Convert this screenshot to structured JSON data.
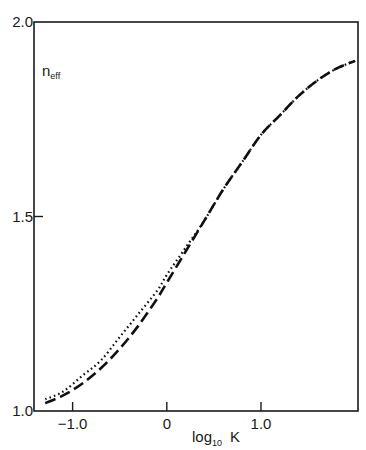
{
  "chart_data": {
    "type": "line",
    "title": "",
    "xlabel": "log",
    "xlabel_subscript": "10",
    "xlabel_suffix": "K",
    "ylabel": "n",
    "ylabel_subscript": "eff",
    "xlim": [
      -1.41,
      2.03
    ],
    "ylim": [
      1.0,
      2.0
    ],
    "grid": false,
    "legend": "none",
    "x_ticks": [
      {
        "value": -1.0,
        "label": "-1.0"
      },
      {
        "value": 0,
        "label": "0"
      },
      {
        "value": 1.0,
        "label": "1.0"
      }
    ],
    "y_ticks": [
      {
        "value": 1.0,
        "label": "1.0"
      },
      {
        "value": 1.5,
        "label": "1.5"
      },
      {
        "value": 2.0,
        "label": "2.0"
      }
    ],
    "series": [
      {
        "name": "dashed",
        "style": "dashed",
        "x": [
          -1.29,
          -1.1,
          -0.9,
          -0.7,
          -0.5,
          -0.3,
          -0.1,
          0.0,
          0.2,
          0.4,
          0.6,
          0.8,
          1.0,
          1.2,
          1.4,
          1.6,
          1.8,
          2.0
        ],
        "y": [
          1.02,
          1.04,
          1.07,
          1.11,
          1.16,
          1.22,
          1.29,
          1.33,
          1.41,
          1.49,
          1.57,
          1.64,
          1.71,
          1.76,
          1.81,
          1.85,
          1.88,
          1.9
        ]
      },
      {
        "name": "dotted",
        "style": "dotted",
        "x": [
          -1.29,
          -1.1,
          -0.9,
          -0.7,
          -0.5,
          -0.3,
          -0.1,
          0.0,
          0.2,
          0.4,
          0.6,
          0.8,
          1.0,
          1.2,
          1.4,
          1.6,
          1.8,
          2.0
        ],
        "y": [
          1.03,
          1.05,
          1.09,
          1.13,
          1.19,
          1.25,
          1.31,
          1.35,
          1.42,
          1.49,
          1.57,
          1.64,
          1.71,
          1.76,
          1.81,
          1.85,
          1.88,
          1.9
        ]
      }
    ]
  }
}
